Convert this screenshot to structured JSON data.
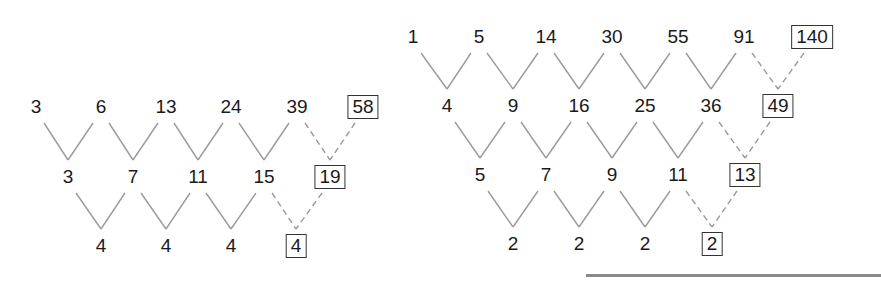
{
  "diagrams": [
    {
      "name": "cubic-difference-table",
      "rows": [
        {
          "y": 107,
          "cells": [
            {
              "v": "3",
              "x": 36
            },
            {
              "v": "6",
              "x": 101
            },
            {
              "v": "13",
              "x": 166
            },
            {
              "v": "24",
              "x": 231
            },
            {
              "v": "39",
              "x": 297
            },
            {
              "v": "58",
              "x": 363,
              "boxed": true
            }
          ]
        },
        {
          "y": 177,
          "cells": [
            {
              "v": "3",
              "x": 68
            },
            {
              "v": "7",
              "x": 133
            },
            {
              "v": "11",
              "x": 198
            },
            {
              "v": "15",
              "x": 264
            },
            {
              "v": "19",
              "x": 330,
              "boxed": true
            }
          ]
        },
        {
          "y": 246,
          "cells": [
            {
              "v": "4",
              "x": 101
            },
            {
              "v": "4",
              "x": 166
            },
            {
              "v": "4",
              "x": 231
            },
            {
              "v": "4",
              "x": 296,
              "boxed": true
            }
          ]
        }
      ]
    },
    {
      "name": "sum-of-squares-difference-table",
      "rows": [
        {
          "y": 37,
          "cells": [
            {
              "v": "1",
              "x": 413
            },
            {
              "v": "5",
              "x": 479
            },
            {
              "v": "14",
              "x": 546
            },
            {
              "v": "30",
              "x": 612
            },
            {
              "v": "55",
              "x": 678
            },
            {
              "v": "91",
              "x": 744
            },
            {
              "v": "140",
              "x": 812,
              "boxed": true
            }
          ]
        },
        {
          "y": 106,
          "cells": [
            {
              "v": "4",
              "x": 447
            },
            {
              "v": "9",
              "x": 513
            },
            {
              "v": "16",
              "x": 579
            },
            {
              "v": "25",
              "x": 645
            },
            {
              "v": "36",
              "x": 711
            },
            {
              "v": "49",
              "x": 778,
              "boxed": true
            }
          ]
        },
        {
          "y": 175,
          "cells": [
            {
              "v": "5",
              "x": 480
            },
            {
              "v": "7",
              "x": 546
            },
            {
              "v": "9",
              "x": 612
            },
            {
              "v": "11",
              "x": 678
            },
            {
              "v": "13",
              "x": 745,
              "boxed": true
            }
          ]
        },
        {
          "y": 244,
          "cells": [
            {
              "v": "2",
              "x": 513
            },
            {
              "v": "2",
              "x": 579
            },
            {
              "v": "2",
              "x": 645
            },
            {
              "v": "2",
              "x": 712,
              "boxed": true
            }
          ]
        }
      ]
    }
  ],
  "colors": {
    "text": "#1a1a1a",
    "connector": "#9a9a9a",
    "dashed_connector": "#9a9a9a",
    "box_border": "#333333",
    "rule": "#8a8a8a"
  }
}
